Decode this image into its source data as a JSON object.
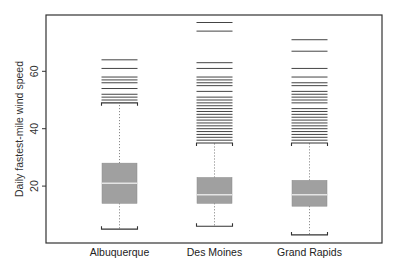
{
  "chart_data": {
    "type": "boxplot",
    "title": "",
    "xlabel": "",
    "ylabel": "Daily fastest-mile wind speed",
    "ylim": [
      0,
      80
    ],
    "yticks": [
      20,
      40,
      60
    ],
    "grid": false,
    "legend": null,
    "categories": [
      "Albuquerque",
      "Des Moines",
      "Grand Rapids"
    ],
    "series": [
      {
        "name": "Albuquerque",
        "whisker_low": 5,
        "q1": 14,
        "median": 21,
        "q3": 28,
        "whisker_high": 49,
        "outliers": [
          50,
          51,
          52,
          54,
          56,
          57,
          58,
          61,
          64
        ]
      },
      {
        "name": "Des Moines",
        "whisker_low": 6,
        "q1": 14,
        "median": 17,
        "q3": 23,
        "whisker_high": 35,
        "outliers": [
          36,
          37,
          38,
          39,
          40,
          41,
          42,
          43,
          44,
          45,
          46,
          47,
          48,
          49,
          50,
          51,
          53,
          55,
          56,
          57,
          58,
          61,
          63,
          74,
          77
        ]
      },
      {
        "name": "Grand Rapids",
        "whisker_low": 3,
        "q1": 13,
        "median": 17,
        "q3": 22,
        "whisker_high": 35,
        "outliers": [
          36,
          37,
          38,
          39,
          40,
          41,
          42,
          43,
          44,
          45,
          46,
          47,
          49,
          50,
          51,
          52,
          53,
          55,
          56,
          58,
          61,
          67,
          71
        ]
      }
    ],
    "colors": {
      "box_fill": "#a0a0a0",
      "median_line": "#e4e4e4",
      "outlier_line": "#444444",
      "frame": "#333333"
    }
  }
}
